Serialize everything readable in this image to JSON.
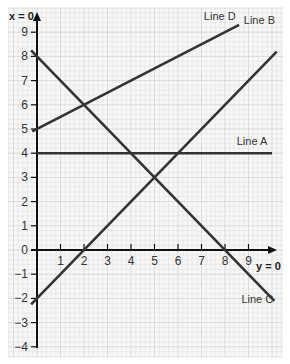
{
  "chart_data": {
    "type": "line",
    "title": "",
    "xlabel": "y = 0",
    "ylabel": "x = 0",
    "xlim": [
      -0.25,
      10.3
    ],
    "ylim": [
      -4.4,
      9.6
    ],
    "x_ticks": [
      1,
      2,
      3,
      4,
      5,
      6,
      7,
      8,
      9
    ],
    "y_ticks": [
      -4,
      -3,
      -2,
      -1,
      0,
      1,
      2,
      3,
      4,
      5,
      6,
      7,
      8,
      9
    ],
    "grid": true,
    "legend_position": "inline labels at line ends",
    "series": [
      {
        "name": "Line A",
        "equation": "y = 4",
        "points": [
          [
            0,
            4
          ],
          [
            10.0,
            4
          ]
        ],
        "label_pos": [
          8.5,
          4.35
        ]
      },
      {
        "name": "Line B",
        "equation": "y = x - 2",
        "points": [
          [
            -0.25,
            -2.25
          ],
          [
            10.2,
            8.2
          ]
        ],
        "label_pos": [
          8.8,
          9.35
        ]
      },
      {
        "name": "Line C",
        "equation": "y = 8 - x",
        "points": [
          [
            -0.25,
            8.25
          ],
          [
            10.1,
            -2.1
          ]
        ],
        "label_pos": [
          8.7,
          -2.2
        ]
      },
      {
        "name": "Line D",
        "equation": "y = 0.5x + 5",
        "points": [
          [
            -0.2,
            4.9
          ],
          [
            8.6,
            9.3
          ]
        ],
        "label_pos": [
          7.1,
          9.5
        ]
      }
    ]
  },
  "colors": {
    "grid_minor": "#e2e2e2",
    "grid_major": "#c9c9c9",
    "axis": "#111111",
    "line": "#333333",
    "background": "#f7f7f7"
  }
}
